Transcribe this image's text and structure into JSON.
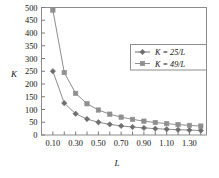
{
  "chart_data": {
    "type": "line",
    "title": "",
    "xlabel": "L",
    "ylabel": "K",
    "xlim": [
      0.0,
      1.45
    ],
    "ylim": [
      0,
      500
    ],
    "grid": false,
    "legend_position": "upper-right",
    "x_tick_labels": [
      "0.10",
      "0.30",
      "0.50",
      "0.70",
      "0.90",
      "1.10",
      "1.30"
    ],
    "x_tick_values": [
      0.1,
      0.3,
      0.5,
      0.7,
      0.9,
      1.1,
      1.3
    ],
    "x_minor_ticks": [
      0.2,
      0.4,
      0.6,
      0.8,
      1.0,
      1.2,
      1.4
    ],
    "y_tick_labels": [
      "0",
      "50",
      "100",
      "150",
      "200",
      "250",
      "300",
      "350",
      "400",
      "450",
      "500"
    ],
    "y_tick_values": [
      0,
      50,
      100,
      150,
      200,
      250,
      300,
      350,
      400,
      450,
      500
    ],
    "x": [
      0.1,
      0.2,
      0.3,
      0.4,
      0.5,
      0.6,
      0.7,
      0.8,
      0.9,
      1.0,
      1.1,
      1.2,
      1.3,
      1.4
    ],
    "series": [
      {
        "name": "K = 25/L",
        "marker": "diamond",
        "color": "#6e6e6e",
        "values": [
          250,
          125,
          83.3,
          62.5,
          50,
          41.7,
          35.7,
          31.3,
          27.8,
          25,
          22.7,
          20.8,
          19.2,
          17.9
        ]
      },
      {
        "name": "K = 49/L",
        "marker": "square",
        "color": "#8f8f8f",
        "values": [
          490,
          245,
          163.3,
          122.5,
          98,
          81.7,
          70,
          61.3,
          54.4,
          49,
          44.5,
          40.8,
          37.7,
          35
        ]
      }
    ]
  },
  "legend": {
    "entries": [
      {
        "label": "K = 25/L",
        "marker": "diamond-marker"
      },
      {
        "label": "K = 49/L",
        "marker": "square-marker"
      }
    ]
  },
  "axes": {
    "y_axis_title": "K",
    "x_axis_title": "L"
  },
  "colors": {
    "series_1": "#6e6e6e",
    "series_2": "#8f8f8f",
    "frame": "#8c8c8c",
    "text": "#141414",
    "background": "#ffffff"
  }
}
